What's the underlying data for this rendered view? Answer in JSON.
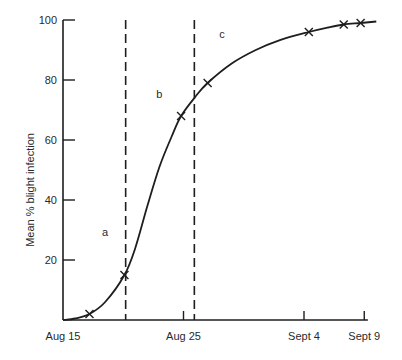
{
  "chart_data": {
    "type": "line",
    "title": "",
    "xlabel": "",
    "ylabel": "Mean % blight infection",
    "ylim": [
      0,
      100
    ],
    "yticks": [
      20,
      40,
      60,
      80,
      100
    ],
    "xticks": [
      {
        "label": "Aug 15",
        "day": 0
      },
      {
        "label": "Aug 25",
        "day": 10
      },
      {
        "label": "Sept 4",
        "day": 20
      },
      {
        "label": "Sept 9",
        "day": 25
      }
    ],
    "grid": false,
    "series": [
      {
        "name": "Mean % blight infection",
        "markers": [
          {
            "day": 2.2,
            "value": 2
          },
          {
            "day": 5.1,
            "value": 15
          },
          {
            "day": 9.8,
            "value": 68
          },
          {
            "day": 12.0,
            "value": 79
          },
          {
            "day": 20.4,
            "value": 96
          },
          {
            "day": 23.3,
            "value": 98.5
          },
          {
            "day": 24.7,
            "value": 99
          }
        ],
        "curve": [
          {
            "day": 0.0,
            "value": 0
          },
          {
            "day": 1.0,
            "value": 0.5
          },
          {
            "day": 2.2,
            "value": 2
          },
          {
            "day": 3.5,
            "value": 6
          },
          {
            "day": 5.1,
            "value": 15
          },
          {
            "day": 6.0,
            "value": 24
          },
          {
            "day": 7.0,
            "value": 38
          },
          {
            "day": 8.0,
            "value": 51
          },
          {
            "day": 9.0,
            "value": 61
          },
          {
            "day": 9.8,
            "value": 68
          },
          {
            "day": 11.0,
            "value": 74.5
          },
          {
            "day": 12.0,
            "value": 79
          },
          {
            "day": 14.0,
            "value": 85.5
          },
          {
            "day": 16.0,
            "value": 90
          },
          {
            "day": 18.0,
            "value": 93.3
          },
          {
            "day": 20.4,
            "value": 96
          },
          {
            "day": 22.0,
            "value": 97.5
          },
          {
            "day": 23.3,
            "value": 98.5
          },
          {
            "day": 24.7,
            "value": 99
          },
          {
            "day": 26.0,
            "value": 99.5
          }
        ]
      }
    ],
    "vertical_dashed_lines": [
      {
        "day": 5.2
      },
      {
        "day": 10.9
      }
    ],
    "annotations": [
      {
        "text": "a",
        "day": 3.5,
        "value": 28
      },
      {
        "text": "b",
        "day": 8.0,
        "value": 74
      },
      {
        "text": "c",
        "day": 13.2,
        "value": 94
      }
    ]
  }
}
